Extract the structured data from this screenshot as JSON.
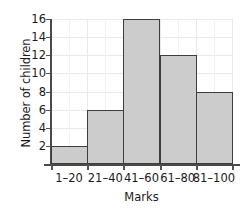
{
  "chart_data": {
    "type": "bar",
    "title": "",
    "xlabel": "Marks",
    "ylabel": "Number of children",
    "categories": [
      "1–20",
      "21–40",
      "41–60",
      "61–80",
      "81–100"
    ],
    "values": [
      2,
      6,
      16,
      12,
      8
    ],
    "ylim": [
      0,
      16
    ],
    "yticks": [
      2,
      4,
      6,
      8,
      10,
      12,
      14,
      16
    ],
    "ytick_labels": [
      "2",
      "4",
      "6",
      "8",
      "10",
      "12",
      "14",
      "16"
    ],
    "grid": true,
    "legend": null,
    "bar_fill_color": "#cccccc",
    "bar_edge_color": "#3d3d3d",
    "grid_color": "#e9e9e9",
    "axis_color": "#4a4a4a",
    "background_color": "#ffffff"
  }
}
